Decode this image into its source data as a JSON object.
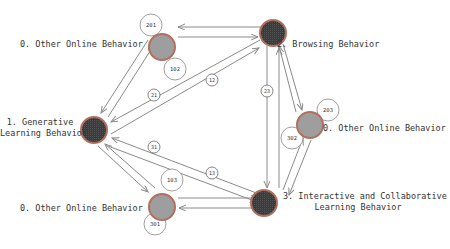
{
  "diagram": {
    "nodes": [
      {
        "id": "n_other_top",
        "label": "0. Other Online Behavior",
        "type": "other",
        "fill": "#9e9e9e"
      },
      {
        "id": "n_browsing",
        "label": "2. Browsing Behavior",
        "type": "state",
        "fill": "#3a3a3a"
      },
      {
        "id": "n_generative",
        "label_line1": "1. Generative",
        "label_line2": "Learning Behavior",
        "type": "state",
        "fill": "#3a3a3a"
      },
      {
        "id": "n_other_right",
        "label": "0. Other Online Behavior",
        "type": "other",
        "fill": "#9e9e9e"
      },
      {
        "id": "n_interactive",
        "label_line1": "3. Interactive and Collaborative",
        "label_line2": "Learning Behavior",
        "type": "state",
        "fill": "#3a3a3a"
      },
      {
        "id": "n_other_bottom",
        "label": "0. Other Online Behavior",
        "type": "other",
        "fill": "#9e9e9e"
      }
    ],
    "bubbles": [
      {
        "node": "n_other_top",
        "text": "201"
      },
      {
        "node": "n_other_top",
        "text": "102"
      },
      {
        "node": "n_other_right",
        "text": "203"
      },
      {
        "node": "n_other_right",
        "text": "302"
      },
      {
        "node": "n_other_bottom",
        "text": "103"
      },
      {
        "node": "n_other_bottom",
        "text": "301"
      }
    ],
    "edge_labels": [
      {
        "from": "n_generative",
        "to": "n_browsing",
        "text": "12"
      },
      {
        "from": "n_browsing",
        "to": "n_generative",
        "text": "21"
      },
      {
        "from": "n_browsing",
        "to": "n_interactive",
        "text": "23"
      },
      {
        "from": "n_interactive",
        "to": "n_generative",
        "text": "31"
      },
      {
        "from": "n_generative",
        "to": "n_interactive",
        "text": "13"
      }
    ],
    "colors": {
      "edge": "#8a8a8a",
      "node_ring": "#b07060",
      "state_fill": "#3a3a3a",
      "other_fill": "#9e9e9e"
    }
  }
}
